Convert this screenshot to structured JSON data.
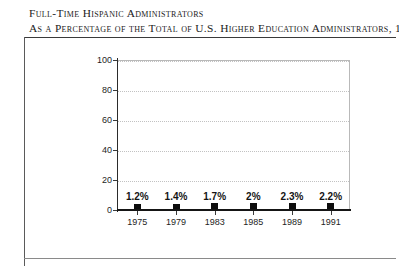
{
  "title": {
    "line1": "Full-Time Hispanic Administrators",
    "line2": "As a Percentage of the Total of U.S. Higher Education Administrators, 1975 to 1991"
  },
  "chart_data": {
    "type": "scatter",
    "title": "Full-Time Hispanic Administrators As a Percentage of the Total of U.S. Higher Education Administrators, 1975 to 1991",
    "xlabel": "",
    "ylabel": "",
    "categories": [
      "1975",
      "1979",
      "1983",
      "1985",
      "1989",
      "1991"
    ],
    "values": [
      1.2,
      1.4,
      1.7,
      2,
      2.3,
      2.2
    ],
    "point_labels": [
      "1.2%",
      "1.4%",
      "1.7%",
      "2%",
      "2.3%",
      "2.2%"
    ],
    "ylim": [
      0,
      100
    ],
    "yticks": [
      0,
      20,
      40,
      60,
      80,
      100
    ],
    "ytick_labels": [
      "0",
      "20",
      "40",
      "60",
      "80",
      "100"
    ],
    "grid": true,
    "legend": false,
    "marker_color": "#0d0d0d",
    "grid_color": "#c2c2c2",
    "axis_color": "#151515",
    "background": "#ffffff"
  }
}
